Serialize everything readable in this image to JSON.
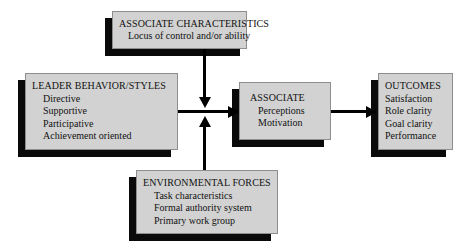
{
  "diagram": {
    "style": {
      "box_fill": "#d2d2d2",
      "box_border": "#8e8e8e",
      "shadow_color": "#0a0a0a",
      "arrow_color": "#000000",
      "text_color": "#111111",
      "background": "#ffffff"
    },
    "boxes": {
      "associate_characteristics": {
        "title": "ASSOCIATE CHARACTERISTICS",
        "items": [
          "Locus of control and/or ability"
        ]
      },
      "leader_behavior": {
        "title": "LEADER BEHAVIOR/STYLES",
        "items": [
          "Directive",
          "Supportive",
          "Participative",
          "Achievement oriented"
        ]
      },
      "associate": {
        "title": "ASSOCIATE",
        "items": [
          "Perceptions",
          "Motivation"
        ]
      },
      "outcomes": {
        "title": "OUTCOMES",
        "items": [
          "Satisfaction",
          "Role clarity",
          "Goal clarity",
          "Performance"
        ]
      },
      "environmental_forces": {
        "title": "ENVIRONMENTAL FORCES",
        "items": [
          "Task characteristics",
          "Formal authority system",
          "Primary work group"
        ]
      }
    },
    "connectors": [
      {
        "name": "leader-to-associate",
        "from": "leader_behavior",
        "to": "associate",
        "direction": "right"
      },
      {
        "name": "characteristics-to-junction",
        "from": "associate_characteristics",
        "to": "associate",
        "direction": "down"
      },
      {
        "name": "environment-to-junction",
        "from": "environmental_forces",
        "to": "associate",
        "direction": "up"
      },
      {
        "name": "associate-to-outcomes",
        "from": "associate",
        "to": "outcomes",
        "direction": "right"
      }
    ]
  }
}
